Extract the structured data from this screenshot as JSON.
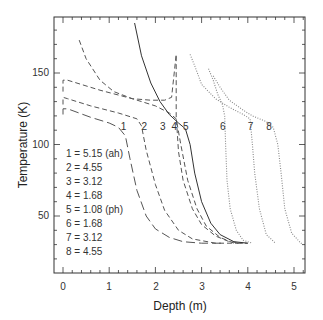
{
  "chart_data": {
    "type": "line",
    "title": "",
    "xlabel": "Depth (m)",
    "ylabel": "Temperature (K)",
    "xlim": [
      -0.2,
      5.2
    ],
    "ylim": [
      10,
      189
    ],
    "xticks": [
      0,
      1,
      2,
      3,
      4,
      5
    ],
    "yticks": [
      50,
      100,
      150
    ],
    "grid": false,
    "legend_position": "inside-left",
    "legend": [
      "1 = 5.15 (ah)",
      "2 = 4.55",
      "3 = 3.12",
      "4 = 1.68",
      "5 = 1.08 (ph)",
      "6 = 1.68",
      "7 = 3.12",
      "8 = 4.55"
    ],
    "series": [
      {
        "name": "1",
        "style": "long-dash",
        "label_at": [
          1.25,
          110
        ],
        "x": [
          0,
          0,
          0.1,
          0.6,
          1.0,
          1.2,
          1.35,
          1.45,
          1.6,
          1.8,
          2.0,
          2.3,
          2.6,
          3.0,
          3.5
        ],
        "y": [
          121,
          125,
          125,
          119,
          115,
          112,
          106,
          90,
          68,
          50,
          41,
          35,
          32,
          31,
          31
        ]
      },
      {
        "name": "2",
        "style": "dash",
        "label_at": [
          1.7,
          110
        ],
        "x": [
          0,
          0,
          0.1,
          0.6,
          1.2,
          1.6,
          1.7,
          1.8,
          2.0,
          2.2,
          2.5,
          2.8,
          3.3,
          3.8
        ],
        "y": [
          128,
          133,
          132,
          127,
          122,
          118,
          113,
          96,
          72,
          54,
          40,
          34,
          31,
          31
        ]
      },
      {
        "name": "3",
        "style": "dash",
        "label_at": [
          2.1,
          110
        ],
        "x": [
          0,
          0,
          0.1,
          0.8,
          1.5,
          2.0,
          2.3,
          2.45,
          2.55,
          2.7,
          2.9,
          3.1,
          3.4,
          3.7,
          4.0
        ],
        "y": [
          137,
          145,
          145,
          138,
          132,
          127,
          122,
          118,
          100,
          75,
          55,
          43,
          35,
          31,
          31
        ]
      },
      {
        "name": "4",
        "style": "dash",
        "label_at": [
          2.35,
          110
        ],
        "x": [
          0.35,
          0.5,
          0.8,
          1.1,
          1.5,
          1.9,
          2.2,
          2.35,
          2.45,
          2.45,
          2.5,
          2.6,
          2.8,
          3.0,
          3.3,
          3.6,
          3.9
        ],
        "y": [
          173,
          160,
          145,
          137,
          132,
          131,
          131,
          133,
          163,
          120,
          95,
          75,
          55,
          44,
          36,
          32,
          31
        ]
      },
      {
        "name": "5",
        "style": "solid",
        "label_at": [
          2.6,
          110
        ],
        "x": [
          1.55,
          1.7,
          1.9,
          2.1,
          2.3,
          2.5,
          2.65,
          2.75,
          2.85,
          3.0,
          3.2,
          3.4,
          3.7,
          4.0
        ],
        "y": [
          185,
          162,
          143,
          130,
          121,
          115,
          111,
          100,
          80,
          60,
          45,
          37,
          32,
          31
        ]
      },
      {
        "name": "6",
        "style": "dotted",
        "label_at": [
          3.4,
          110
        ],
        "x": [
          3.15,
          3.25,
          3.35,
          3.45,
          3.5,
          3.52,
          3.55,
          3.62,
          3.75,
          3.9,
          4.1
        ],
        "y": [
          153,
          145,
          135,
          128,
          120,
          100,
          75,
          55,
          40,
          33,
          31
        ]
      },
      {
        "name": "7",
        "style": "dotted",
        "label_at": [
          4.0,
          110
        ],
        "x": [
          2.75,
          2.85,
          3.0,
          3.3,
          3.6,
          3.9,
          4.05,
          4.1,
          4.15,
          4.25,
          4.4,
          4.6
        ],
        "y": [
          163,
          155,
          142,
          132,
          126,
          121,
          118,
          100,
          80,
          55,
          37,
          31
        ]
      },
      {
        "name": "8",
        "style": "dotted",
        "label_at": [
          4.4,
          110
        ],
        "x": [
          3.25,
          3.4,
          3.6,
          3.9,
          4.1,
          4.4,
          4.55,
          4.65,
          4.72,
          4.8,
          4.95,
          5.15,
          5.2
        ],
        "y": [
          148,
          140,
          131,
          124,
          120,
          116,
          112,
          100,
          80,
          55,
          38,
          31,
          31
        ]
      }
    ]
  },
  "axes": {
    "xlabel": "Depth (m)",
    "ylabel": "Temperature (K)",
    "xtick_labels": [
      "0",
      "1",
      "2",
      "3",
      "4",
      "5"
    ],
    "ytick_labels": [
      "50",
      "100",
      "150"
    ]
  },
  "legend": {
    "items": [
      "1 = 5.15 (ah)",
      "2 = 4.55",
      "3 = 3.12",
      "4 = 1.68",
      "5 = 1.08 (ph)",
      "6 = 1.68",
      "7 = 3.12",
      "8 = 4.55"
    ]
  },
  "curve_labels": [
    "1",
    "2",
    "3",
    "4",
    "5",
    "6",
    "7",
    "8"
  ]
}
